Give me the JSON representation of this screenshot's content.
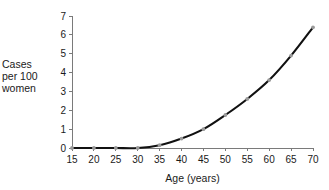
{
  "chart_data": {
    "type": "line",
    "title": "",
    "subtitle": "",
    "xlabel": "Age (years)",
    "ylabel": "Cases per 100 women",
    "ylabel_lines": [
      "Cases",
      "per 100",
      "women"
    ],
    "xlim": [
      15,
      70
    ],
    "ylim": [
      0,
      7
    ],
    "xticks": [
      15,
      20,
      25,
      30,
      35,
      40,
      45,
      50,
      55,
      60,
      65,
      70
    ],
    "yticks": [
      0,
      1,
      2,
      3,
      4,
      5,
      6,
      7
    ],
    "xtick_labels": [
      "15",
      "20",
      "25",
      "30",
      "35",
      "40",
      "45",
      "50",
      "55",
      "60",
      "65",
      "70"
    ],
    "ytick_labels": [
      "0",
      "1",
      "2",
      "3",
      "4",
      "5",
      "6",
      "7"
    ],
    "grid": false,
    "legend": false,
    "legend_position": "none",
    "x": [
      15,
      20,
      25,
      30,
      35,
      40,
      45,
      50,
      55,
      60,
      65,
      70
    ],
    "values": [
      0,
      0,
      0,
      0,
      0.15,
      0.5,
      1.0,
      1.75,
      2.6,
      3.6,
      4.9,
      6.4
    ],
    "series": [
      {
        "name": "Cases per 100 women",
        "x": [
          15,
          20,
          25,
          30,
          35,
          40,
          45,
          50,
          55,
          60,
          65,
          70
        ],
        "values": [
          0,
          0,
          0,
          0,
          0.15,
          0.5,
          1.0,
          1.75,
          2.6,
          3.6,
          4.9,
          6.4
        ],
        "line_color": "#111111",
        "marker_color": "#9a9a9a"
      }
    ],
    "annotations": []
  },
  "style": {
    "axis_color": "#7a7a7a",
    "line_color": "#111111",
    "marker_color": "#9a9a9a",
    "text_color": "#1a1a1a",
    "background": "#ffffff"
  }
}
